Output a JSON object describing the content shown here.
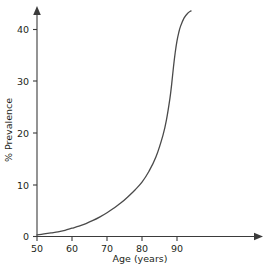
{
  "chart_data": {
    "type": "line",
    "title": "",
    "xlabel": "Age (years)",
    "ylabel": "% Prevalence",
    "xlim": [
      50,
      95
    ],
    "ylim": [
      0,
      44
    ],
    "xticks": [
      50,
      60,
      70,
      80,
      90
    ],
    "xtick_labels": [
      "50",
      "60",
      "70",
      "80",
      "90"
    ],
    "yticks": [
      0,
      10,
      20,
      30,
      40
    ],
    "ytick_labels": [
      "0",
      "10",
      "20",
      "30",
      "40"
    ],
    "grid": false,
    "legend": false,
    "series": [
      {
        "name": "Prevalence",
        "color": "#4a4a4a",
        "x": [
          50,
          52,
          54,
          56,
          58,
          60,
          62,
          64,
          66,
          68,
          70,
          72,
          74,
          76,
          78,
          80,
          82,
          84,
          86,
          87,
          88,
          88.5,
          89,
          89.5,
          90,
          90.5,
          91,
          92,
          93,
          94
        ],
        "values": [
          0.3,
          0.5,
          0.7,
          0.9,
          1.2,
          1.6,
          2.0,
          2.5,
          3.1,
          3.8,
          4.6,
          5.5,
          6.5,
          7.7,
          9.0,
          10.5,
          12.6,
          15.4,
          19.6,
          22.6,
          26.8,
          29.6,
          32.8,
          35.6,
          37.8,
          39.4,
          40.6,
          42.2,
          43.1,
          43.6
        ]
      }
    ]
  },
  "axis": {
    "x_label": "Age (years)",
    "y_label": "% Prevalence"
  },
  "ticks": {
    "x": [
      "50",
      "60",
      "70",
      "80",
      "90"
    ],
    "y": [
      "0",
      "10",
      "20",
      "30",
      "40"
    ]
  },
  "colors": {
    "curve": "#4a4a4a",
    "axis": "#3b3b3b",
    "text": "#231f20",
    "background": "#ffffff"
  }
}
